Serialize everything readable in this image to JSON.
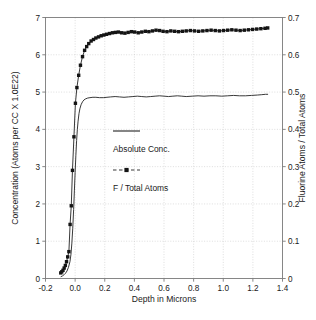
{
  "chart_data": {
    "type": "line",
    "title": "",
    "xlabel": "Depth in Microns",
    "ylabel": "Concentration (Atoms per CC X 1.0E22)",
    "y2label": "Fluorine Atoms / Total Atoms",
    "xlim": [
      -0.2,
      1.4
    ],
    "ylim": [
      0,
      7
    ],
    "y2lim": [
      0,
      0.7
    ],
    "grid": true,
    "legend_position": "center",
    "xticks": [
      "-0.2",
      "0.0",
      "0.2",
      "0.4",
      "0.6",
      "0.8",
      "1.0",
      "1.2",
      "1.4"
    ],
    "xtick_values": [
      -0.2,
      0.0,
      0.2,
      0.4,
      0.6,
      0.8,
      1.0,
      1.2,
      1.4
    ],
    "yticks": [
      "0",
      "1",
      "2",
      "3",
      "4",
      "5",
      "6",
      "7"
    ],
    "ytick_values": [
      0,
      1,
      2,
      3,
      4,
      5,
      6,
      7
    ],
    "y2ticks": [
      "0",
      "0.1",
      "0.2",
      "0.3",
      "0.4",
      "0.5",
      "0.6",
      "0.7"
    ],
    "y2tick_values": [
      0,
      0.1,
      0.2,
      0.3,
      0.4,
      0.5,
      0.6,
      0.7
    ],
    "series": [
      {
        "name": "Absolute Conc.",
        "axis": "left",
        "style": "line",
        "marker": "none",
        "color": "#222222",
        "x": [
          -0.095,
          -0.085,
          -0.075,
          -0.065,
          -0.055,
          -0.045,
          -0.035,
          -0.028,
          -0.022,
          -0.016,
          -0.01,
          -0.005,
          0.0,
          0.005,
          0.01,
          0.015,
          0.02,
          0.026,
          0.032,
          0.04,
          0.05,
          0.06,
          0.072,
          0.085,
          0.1,
          0.12,
          0.14,
          0.165,
          0.19,
          0.215,
          0.24,
          0.27,
          0.3,
          0.33,
          0.36,
          0.39,
          0.42,
          0.45,
          0.48,
          0.51,
          0.54,
          0.57,
          0.6,
          0.63,
          0.66,
          0.69,
          0.72,
          0.75,
          0.79,
          0.83,
          0.87,
          0.91,
          0.95,
          0.99,
          1.03,
          1.07,
          1.11,
          1.15,
          1.19,
          1.23,
          1.26,
          1.285,
          1.3
        ],
        "y": [
          0.05,
          0.07,
          0.1,
          0.14,
          0.2,
          0.3,
          0.45,
          0.65,
          0.95,
          1.35,
          1.85,
          2.35,
          2.85,
          3.3,
          3.7,
          4.0,
          4.22,
          4.42,
          4.55,
          4.66,
          4.74,
          4.79,
          4.82,
          4.84,
          4.85,
          4.86,
          4.86,
          4.85,
          4.85,
          4.86,
          4.87,
          4.88,
          4.87,
          4.86,
          4.87,
          4.88,
          4.89,
          4.88,
          4.87,
          4.88,
          4.89,
          4.9,
          4.89,
          4.88,
          4.89,
          4.9,
          4.89,
          4.88,
          4.89,
          4.9,
          4.89,
          4.9,
          4.9,
          4.89,
          4.9,
          4.91,
          4.9,
          4.9,
          4.91,
          4.92,
          4.93,
          4.94,
          4.94
        ]
      },
      {
        "name": "F / Total Atoms",
        "axis": "right",
        "style": "line-marker",
        "marker": "square",
        "color": "#141414",
        "x": [
          -0.097,
          -0.09,
          -0.082,
          -0.074,
          -0.066,
          -0.058,
          -0.05,
          -0.042,
          -0.034,
          -0.026,
          -0.018,
          -0.008,
          0.002,
          0.012,
          0.024,
          0.036,
          0.05,
          0.064,
          0.078,
          0.092,
          0.108,
          0.124,
          0.14,
          0.158,
          0.176,
          0.194,
          0.212,
          0.232,
          0.252,
          0.272,
          0.292,
          0.314,
          0.336,
          0.358,
          0.38,
          0.402,
          0.426,
          0.45,
          0.474,
          0.498,
          0.522,
          0.546,
          0.57,
          0.594,
          0.62,
          0.646,
          0.672,
          0.698,
          0.724,
          0.75,
          0.778,
          0.806,
          0.834,
          0.862,
          0.89,
          0.918,
          0.946,
          0.974,
          1.002,
          1.03,
          1.058,
          1.086,
          1.114,
          1.142,
          1.17,
          1.198,
          1.226,
          1.254,
          1.282,
          1.3
        ],
        "y": [
          0.015,
          0.018,
          0.022,
          0.028,
          0.035,
          0.045,
          0.058,
          0.072,
          0.145,
          0.195,
          0.29,
          0.38,
          0.47,
          0.512,
          0.545,
          0.572,
          0.595,
          0.612,
          0.622,
          0.63,
          0.637,
          0.641,
          0.645,
          0.648,
          0.651,
          0.653,
          0.655,
          0.657,
          0.659,
          0.66,
          0.661,
          0.659,
          0.658,
          0.66,
          0.662,
          0.661,
          0.659,
          0.661,
          0.663,
          0.662,
          0.664,
          0.666,
          0.665,
          0.663,
          0.662,
          0.664,
          0.663,
          0.662,
          0.663,
          0.664,
          0.665,
          0.664,
          0.663,
          0.664,
          0.665,
          0.666,
          0.665,
          0.664,
          0.665,
          0.666,
          0.667,
          0.666,
          0.665,
          0.666,
          0.667,
          0.668,
          0.669,
          0.67,
          0.671,
          0.672
        ]
      }
    ],
    "legend_entries": [
      {
        "label": "Absolute Conc.",
        "style": "line",
        "marker": "none"
      },
      {
        "label": "F / Total Atoms",
        "style": "line-marker",
        "marker": "square"
      }
    ]
  },
  "axes": {
    "left_title": "Concentration (Atoms per CC X 1.0E22)",
    "right_title": "Fluorine Atoms / Total Atoms",
    "bottom_title": "Depth in Microns"
  },
  "legend": {
    "entry_1_label": "Absolute Conc.",
    "entry_2_label": "F / Total Atoms"
  },
  "colors": {
    "line": "#222222",
    "marker": "#141414",
    "grid": "#c8c8c8",
    "frame": "#7a7a7a",
    "text": "#1a1a1a",
    "background": "#ffffff"
  }
}
